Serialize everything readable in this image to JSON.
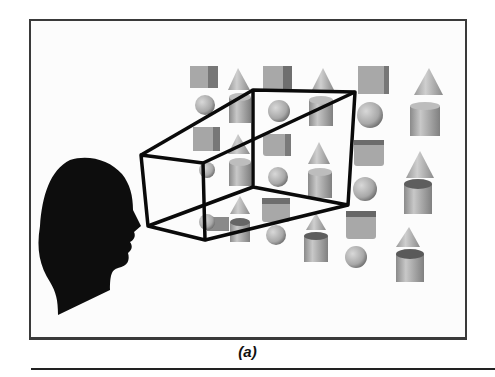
{
  "figure": {
    "caption": "(a)",
    "colors": {
      "frame_border": "#3a3a3a",
      "silhouette": "#0d0d0d",
      "frustum_lines": "#0a0a0a",
      "shape_fill": "#b5b5b5",
      "shape_shadow": "#7a7a7a"
    },
    "elements": {
      "head": "head-silhouette",
      "frustum": "view-frustum",
      "shapes": [
        "cube",
        "cone",
        "sphere",
        "cylinder"
      ]
    }
  }
}
